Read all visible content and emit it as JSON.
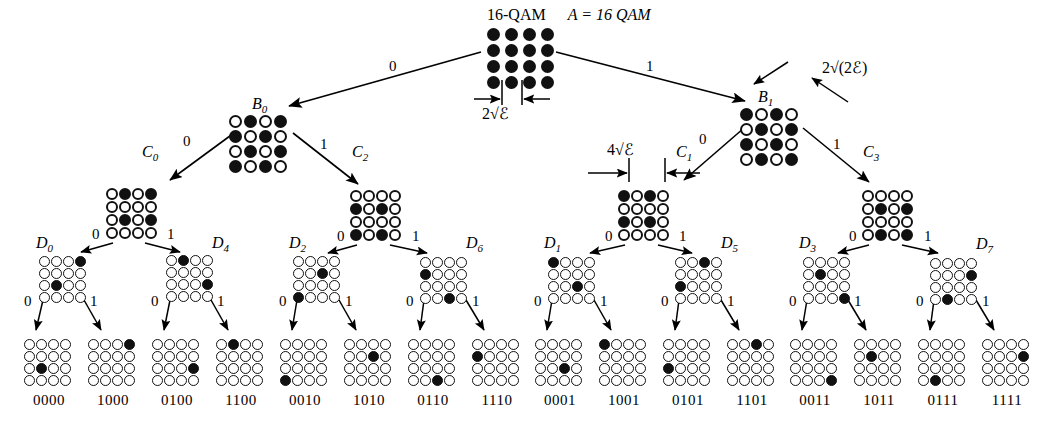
{
  "title": {
    "qam": "16-QAM",
    "set": "A = 16 QAM"
  },
  "annotations": {
    "root_spacing": "2√ℰ",
    "b1_spacing": "2√(2ℰ)",
    "c1_spacing": "4√ℰ"
  },
  "bit_labels": {
    "zero": "0",
    "one": "1"
  },
  "nodes": {
    "root": {
      "name": "A",
      "grid": [
        [
          1,
          1,
          1,
          1
        ],
        [
          1,
          1,
          1,
          1
        ],
        [
          1,
          1,
          1,
          1
        ],
        [
          1,
          1,
          1,
          1
        ]
      ]
    },
    "B0": {
      "name": "B0",
      "label": "B",
      "sub": "0",
      "grid": [
        [
          0,
          1,
          0,
          1
        ],
        [
          1,
          0,
          1,
          0
        ],
        [
          0,
          1,
          0,
          1
        ],
        [
          1,
          0,
          1,
          0
        ]
      ]
    },
    "B1": {
      "name": "B1",
      "label": "B",
      "sub": "1",
      "grid": [
        [
          1,
          0,
          1,
          0
        ],
        [
          0,
          1,
          0,
          1
        ],
        [
          1,
          0,
          1,
          0
        ],
        [
          0,
          1,
          0,
          1
        ]
      ]
    },
    "C0": {
      "name": "C0",
      "label": "C",
      "sub": "0",
      "grid": [
        [
          0,
          1,
          0,
          1
        ],
        [
          0,
          0,
          0,
          0
        ],
        [
          0,
          1,
          0,
          1
        ],
        [
          0,
          0,
          0,
          0
        ]
      ]
    },
    "C2": {
      "name": "C2",
      "label": "C",
      "sub": "2",
      "grid": [
        [
          0,
          0,
          0,
          0
        ],
        [
          1,
          0,
          1,
          0
        ],
        [
          0,
          0,
          0,
          0
        ],
        [
          1,
          0,
          1,
          0
        ]
      ]
    },
    "C1": {
      "name": "C1",
      "label": "C",
      "sub": "1",
      "grid": [
        [
          1,
          0,
          1,
          0
        ],
        [
          0,
          0,
          0,
          0
        ],
        [
          1,
          0,
          1,
          0
        ],
        [
          0,
          0,
          0,
          0
        ]
      ]
    },
    "C3": {
      "name": "C3",
      "label": "C",
      "sub": "3",
      "grid": [
        [
          0,
          0,
          0,
          0
        ],
        [
          0,
          1,
          0,
          1
        ],
        [
          0,
          0,
          0,
          0
        ],
        [
          0,
          1,
          0,
          1
        ]
      ]
    },
    "D0": {
      "name": "D0",
      "label": "D",
      "sub": "0",
      "grid": [
        [
          0,
          0,
          0,
          1
        ],
        [
          0,
          0,
          0,
          0
        ],
        [
          0,
          1,
          0,
          0
        ],
        [
          0,
          0,
          0,
          0
        ]
      ]
    },
    "D4": {
      "name": "D4",
      "label": "D",
      "sub": "4",
      "grid": [
        [
          0,
          1,
          0,
          0
        ],
        [
          0,
          0,
          0,
          0
        ],
        [
          0,
          0,
          0,
          1
        ],
        [
          0,
          0,
          0,
          0
        ]
      ]
    },
    "D2": {
      "name": "D2",
      "label": "D",
      "sub": "2",
      "grid": [
        [
          0,
          0,
          0,
          0
        ],
        [
          0,
          0,
          1,
          0
        ],
        [
          0,
          0,
          0,
          0
        ],
        [
          1,
          0,
          0,
          0
        ]
      ]
    },
    "D6": {
      "name": "D6",
      "label": "D",
      "sub": "6",
      "grid": [
        [
          0,
          0,
          0,
          0
        ],
        [
          1,
          0,
          0,
          0
        ],
        [
          0,
          0,
          0,
          0
        ],
        [
          0,
          0,
          1,
          0
        ]
      ]
    },
    "D1": {
      "name": "D1",
      "label": "D",
      "sub": "1",
      "grid": [
        [
          1,
          0,
          0,
          0
        ],
        [
          0,
          0,
          0,
          0
        ],
        [
          0,
          0,
          1,
          0
        ],
        [
          0,
          0,
          0,
          0
        ]
      ]
    },
    "D5": {
      "name": "D5",
      "label": "D",
      "sub": "5",
      "grid": [
        [
          0,
          0,
          1,
          0
        ],
        [
          0,
          0,
          0,
          0
        ],
        [
          1,
          0,
          0,
          0
        ],
        [
          0,
          0,
          0,
          0
        ]
      ]
    },
    "D3": {
      "name": "D3",
      "label": "D",
      "sub": "3",
      "grid": [
        [
          0,
          0,
          0,
          0
        ],
        [
          0,
          1,
          0,
          0
        ],
        [
          0,
          0,
          0,
          0
        ],
        [
          0,
          0,
          0,
          1
        ]
      ]
    },
    "D7": {
      "name": "D7",
      "label": "D",
      "sub": "7",
      "grid": [
        [
          0,
          0,
          0,
          0
        ],
        [
          0,
          0,
          0,
          1
        ],
        [
          0,
          0,
          0,
          0
        ],
        [
          0,
          1,
          0,
          0
        ]
      ]
    }
  },
  "leaves": [
    {
      "code": "0000",
      "grid": [
        [
          0,
          0,
          0,
          0
        ],
        [
          0,
          0,
          0,
          0
        ],
        [
          0,
          1,
          0,
          0
        ],
        [
          0,
          0,
          0,
          0
        ]
      ]
    },
    {
      "code": "1000",
      "grid": [
        [
          0,
          0,
          0,
          1
        ],
        [
          0,
          0,
          0,
          0
        ],
        [
          0,
          0,
          0,
          0
        ],
        [
          0,
          0,
          0,
          0
        ]
      ]
    },
    {
      "code": "0100",
      "grid": [
        [
          0,
          0,
          0,
          0
        ],
        [
          0,
          0,
          0,
          0
        ],
        [
          0,
          0,
          0,
          1
        ],
        [
          0,
          0,
          0,
          0
        ]
      ]
    },
    {
      "code": "1100",
      "grid": [
        [
          0,
          1,
          0,
          0
        ],
        [
          0,
          0,
          0,
          0
        ],
        [
          0,
          0,
          0,
          0
        ],
        [
          0,
          0,
          0,
          0
        ]
      ]
    },
    {
      "code": "0010",
      "grid": [
        [
          0,
          0,
          0,
          0
        ],
        [
          0,
          0,
          0,
          0
        ],
        [
          0,
          0,
          0,
          0
        ],
        [
          1,
          0,
          0,
          0
        ]
      ]
    },
    {
      "code": "1010",
      "grid": [
        [
          0,
          0,
          0,
          0
        ],
        [
          0,
          0,
          1,
          0
        ],
        [
          0,
          0,
          0,
          0
        ],
        [
          0,
          0,
          0,
          0
        ]
      ]
    },
    {
      "code": "0110",
      "grid": [
        [
          0,
          0,
          0,
          0
        ],
        [
          0,
          0,
          0,
          0
        ],
        [
          0,
          0,
          0,
          0
        ],
        [
          0,
          0,
          1,
          0
        ]
      ]
    },
    {
      "code": "1110",
      "grid": [
        [
          0,
          0,
          0,
          0
        ],
        [
          1,
          0,
          0,
          0
        ],
        [
          0,
          0,
          0,
          0
        ],
        [
          0,
          0,
          0,
          0
        ]
      ]
    },
    {
      "code": "0001",
      "grid": [
        [
          0,
          0,
          0,
          0
        ],
        [
          0,
          0,
          0,
          0
        ],
        [
          0,
          0,
          1,
          0
        ],
        [
          0,
          0,
          0,
          0
        ]
      ]
    },
    {
      "code": "1001",
      "grid": [
        [
          1,
          0,
          0,
          0
        ],
        [
          0,
          0,
          0,
          0
        ],
        [
          0,
          0,
          0,
          0
        ],
        [
          0,
          0,
          0,
          0
        ]
      ]
    },
    {
      "code": "0101",
      "grid": [
        [
          0,
          0,
          0,
          0
        ],
        [
          0,
          0,
          0,
          0
        ],
        [
          1,
          0,
          0,
          0
        ],
        [
          0,
          0,
          0,
          0
        ]
      ]
    },
    {
      "code": "1101",
      "grid": [
        [
          0,
          0,
          1,
          0
        ],
        [
          0,
          0,
          0,
          0
        ],
        [
          0,
          0,
          0,
          0
        ],
        [
          0,
          0,
          0,
          0
        ]
      ]
    },
    {
      "code": "0011",
      "grid": [
        [
          0,
          0,
          0,
          0
        ],
        [
          0,
          0,
          0,
          0
        ],
        [
          0,
          0,
          0,
          0
        ],
        [
          0,
          0,
          0,
          1
        ]
      ]
    },
    {
      "code": "1011",
      "grid": [
        [
          0,
          0,
          0,
          0
        ],
        [
          0,
          1,
          0,
          0
        ],
        [
          0,
          0,
          0,
          0
        ],
        [
          0,
          0,
          0,
          0
        ]
      ]
    },
    {
      "code": "0111",
      "grid": [
        [
          0,
          0,
          0,
          0
        ],
        [
          0,
          0,
          0,
          0
        ],
        [
          0,
          0,
          0,
          0
        ],
        [
          0,
          1,
          0,
          0
        ]
      ]
    },
    {
      "code": "1111",
      "grid": [
        [
          0,
          0,
          0,
          0
        ],
        [
          0,
          0,
          0,
          1
        ],
        [
          0,
          0,
          0,
          0
        ],
        [
          0,
          0,
          0,
          0
        ]
      ]
    }
  ],
  "layout": {
    "root": {
      "x": 487,
      "y": 28
    },
    "B0": {
      "x": 229,
      "y": 115
    },
    "B1": {
      "x": 740,
      "y": 108
    },
    "C0": {
      "x": 106,
      "y": 188
    },
    "C2": {
      "x": 350,
      "y": 190
    },
    "C1": {
      "x": 618,
      "y": 190
    },
    "C3": {
      "x": 862,
      "y": 190
    },
    "D0": {
      "x": 39,
      "y": 256
    },
    "D4": {
      "x": 166,
      "y": 255
    },
    "D2": {
      "x": 293,
      "y": 256
    },
    "D6": {
      "x": 420,
      "y": 257
    },
    "D1": {
      "x": 548,
      "y": 257
    },
    "D5": {
      "x": 675,
      "y": 257
    },
    "D3": {
      "x": 803,
      "y": 257
    },
    "D7": {
      "x": 930,
      "y": 258
    },
    "leaf_y": 339,
    "leaf_x": [
      24,
      88,
      152,
      216,
      280,
      344,
      408,
      472,
      535,
      599,
      663,
      727,
      790,
      854,
      918,
      982
    ],
    "leaf_label_y": 392
  }
}
